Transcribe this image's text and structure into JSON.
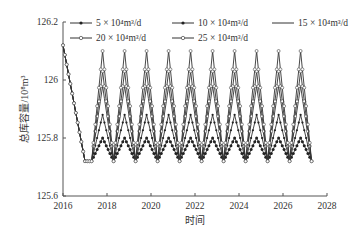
{
  "chart_data": {
    "type": "line",
    "title": "",
    "xlabel": "时间",
    "ylabel": "总库容量/10⁸m³",
    "xlim": [
      2016,
      2028
    ],
    "ylim": [
      125.6,
      126.2
    ],
    "xticks": [
      "2016",
      "2018",
      "2020",
      "2022",
      "2024",
      "2026",
      "2028"
    ],
    "yticks": [
      "125.6",
      "125.8",
      "126",
      "126.2"
    ],
    "grid": false,
    "legend_position": "top",
    "common_start": {
      "x": [
        2016.0,
        2017.0,
        2017.3
      ],
      "y": [
        126.12,
        125.72,
        125.72
      ]
    },
    "cycle": {
      "first_peak_year": 2017.8,
      "period_years": 1,
      "num_peaks": 10,
      "trough": 125.72,
      "end_year": 2027.3
    },
    "series": [
      {
        "name": "5×10⁴m³/d",
        "marker": "filled-dot",
        "peak": 125.8
      },
      {
        "name": "10×10⁴m³/d",
        "marker": "filled-dot-small",
        "peak": 125.88
      },
      {
        "name": "15×10⁴m³/d",
        "marker": "none",
        "peak": 125.98
      },
      {
        "name": "20×10⁴m³/d",
        "marker": "open-diamond",
        "peak": 126.03
      },
      {
        "name": "25×10⁴m³/d",
        "marker": "open-circle",
        "peak": 126.1
      }
    ]
  },
  "legend": {
    "items": [
      {
        "label": "5 × 10⁴m³/d"
      },
      {
        "label": "10 × 10⁴m³/d"
      },
      {
        "label": "15 × 10⁴m³/d"
      },
      {
        "label": "20 × 10⁴m³/d"
      },
      {
        "label": "25 × 10⁴m³/d"
      }
    ]
  },
  "axes": {
    "xlabel": "时间",
    "ylabel": "总库容量/10⁸m³"
  }
}
